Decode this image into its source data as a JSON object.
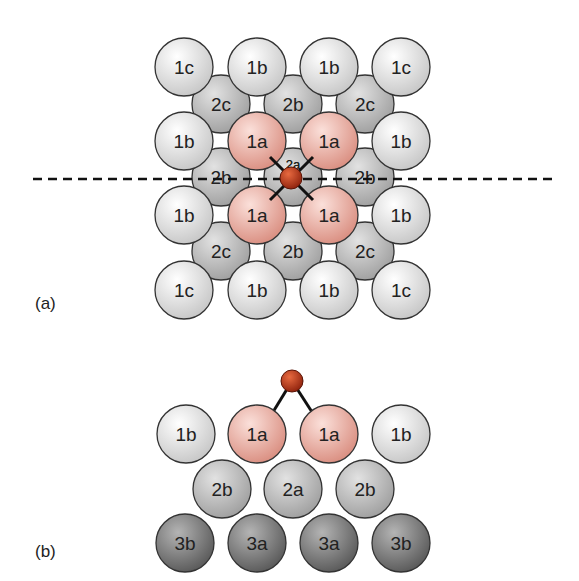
{
  "figure": {
    "panels": [
      {
        "id": "a",
        "label": "(a)",
        "view": "top",
        "label_pos": [
          35,
          312
        ],
        "dashed_line": {
          "x1": 33,
          "x2": 553,
          "y": 179
        },
        "layer2": [
          {
            "label": "2c",
            "x": 221,
            "y": 104
          },
          {
            "label": "2b",
            "x": 293,
            "y": 104
          },
          {
            "label": "2c",
            "x": 365,
            "y": 104
          },
          {
            "label": "2b",
            "x": 221,
            "y": 177
          },
          {
            "label": "2a",
            "x": 293,
            "y": 177,
            "small": true
          },
          {
            "label": "2b",
            "x": 365,
            "y": 177
          },
          {
            "label": "2c",
            "x": 221,
            "y": 251
          },
          {
            "label": "2b",
            "x": 293,
            "y": 251
          },
          {
            "label": "2c",
            "x": 365,
            "y": 251
          }
        ],
        "layer1": [
          {
            "label": "1c",
            "x": 184,
            "y": 67,
            "kind": "white"
          },
          {
            "label": "1b",
            "x": 257,
            "y": 67,
            "kind": "white"
          },
          {
            "label": "1b",
            "x": 329,
            "y": 67,
            "kind": "white"
          },
          {
            "label": "1c",
            "x": 401,
            "y": 67,
            "kind": "white"
          },
          {
            "label": "1b",
            "x": 184,
            "y": 141,
            "kind": "white"
          },
          {
            "label": "1a",
            "x": 257,
            "y": 141,
            "kind": "pink"
          },
          {
            "label": "1a",
            "x": 329,
            "y": 141,
            "kind": "pink"
          },
          {
            "label": "1b",
            "x": 401,
            "y": 141,
            "kind": "white"
          },
          {
            "label": "1b",
            "x": 184,
            "y": 215,
            "kind": "white"
          },
          {
            "label": "1a",
            "x": 257,
            "y": 215,
            "kind": "pink"
          },
          {
            "label": "1a",
            "x": 329,
            "y": 215,
            "kind": "pink"
          },
          {
            "label": "1b",
            "x": 401,
            "y": 215,
            "kind": "white"
          },
          {
            "label": "1c",
            "x": 184,
            "y": 290,
            "kind": "white"
          },
          {
            "label": "1b",
            "x": 257,
            "y": 290,
            "kind": "white"
          },
          {
            "label": "1b",
            "x": 329,
            "y": 290,
            "kind": "white"
          },
          {
            "label": "1c",
            "x": 401,
            "y": 290,
            "kind": "white"
          }
        ],
        "adsorbate": {
          "x": 291,
          "y": 178,
          "r": 11
        },
        "bonds": [
          {
            "x1": 270,
            "y1": 157,
            "x2": 313,
            "y2": 200
          },
          {
            "x1": 313,
            "y1": 157,
            "x2": 270,
            "y2": 200
          }
        ]
      },
      {
        "id": "b",
        "label": "(b)",
        "view": "side",
        "label_pos": [
          35,
          560
        ],
        "layer3": [
          {
            "label": "3b",
            "x": 185,
            "y": 543
          },
          {
            "label": "3a",
            "x": 257,
            "y": 543
          },
          {
            "label": "3a",
            "x": 329,
            "y": 543
          },
          {
            "label": "3b",
            "x": 401,
            "y": 543
          }
        ],
        "layer2": [
          {
            "label": "2b",
            "x": 222,
            "y": 489
          },
          {
            "label": "2a",
            "x": 293,
            "y": 489
          },
          {
            "label": "2b",
            "x": 365,
            "y": 489
          }
        ],
        "layer1": [
          {
            "label": "1b",
            "x": 186,
            "y": 434,
            "kind": "white"
          },
          {
            "label": "1a",
            "x": 257,
            "y": 434,
            "kind": "pink"
          },
          {
            "label": "1a",
            "x": 329,
            "y": 434,
            "kind": "pink"
          },
          {
            "label": "1b",
            "x": 401,
            "y": 434,
            "kind": "white"
          }
        ],
        "adsorbate": {
          "x": 292,
          "y": 381,
          "r": 11
        },
        "bonds": [
          {
            "x1": 292,
            "y1": 381,
            "x2": 273,
            "y2": 412
          },
          {
            "x1": 292,
            "y1": 381,
            "x2": 312,
            "y2": 412
          }
        ]
      }
    ],
    "sphere_radius": 29,
    "colors": {
      "white_light": "#ffffff",
      "white_dark": "#c4c4c4",
      "pink_light": "#fbe0da",
      "pink_dark": "#d88a7c",
      "gray2_light": "#e2e2e2",
      "gray2_dark": "#9c9c9c",
      "gray3_light": "#b4b4b4",
      "gray3_dark": "#555555",
      "adsorbate_light": "#e86a40",
      "adsorbate_dark": "#8a1e0a",
      "outline": "#333333",
      "text": "#222222"
    }
  }
}
